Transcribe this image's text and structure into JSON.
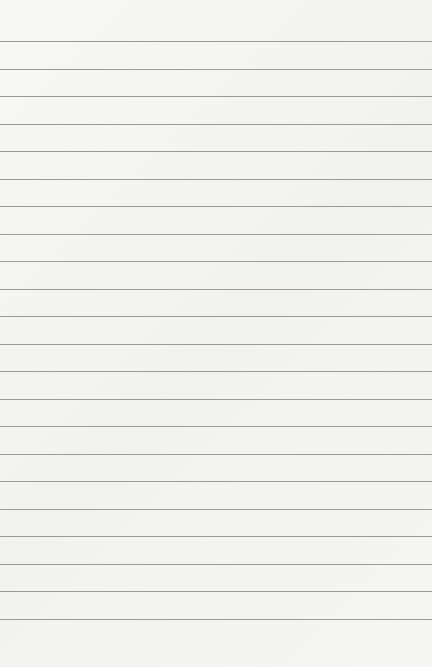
{
  "paper": {
    "type": "lined-paper",
    "background_color": "#f4f4f2",
    "line_color": "#8a8a8a",
    "line_count": 22,
    "first_line_y": 41,
    "line_spacing": 27.52
  }
}
